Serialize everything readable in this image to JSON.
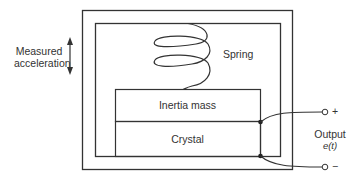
{
  "diagram": {
    "labels": {
      "measured_line1": "Measured",
      "measured_line2": "acceleration",
      "spring": "Spring",
      "inertia_mass": "Inertia mass",
      "crystal": "Crystal",
      "output": "Output",
      "output_signal": "e(t)",
      "terminal_plus": "+",
      "terminal_minus": "−"
    },
    "colors": {
      "stroke": "#333333",
      "background": "#ffffff"
    },
    "components": [
      "outer housing",
      "inner housing",
      "spring",
      "inertia mass",
      "crystal",
      "output terminals"
    ],
    "arrow": "bidirectional vertical"
  }
}
